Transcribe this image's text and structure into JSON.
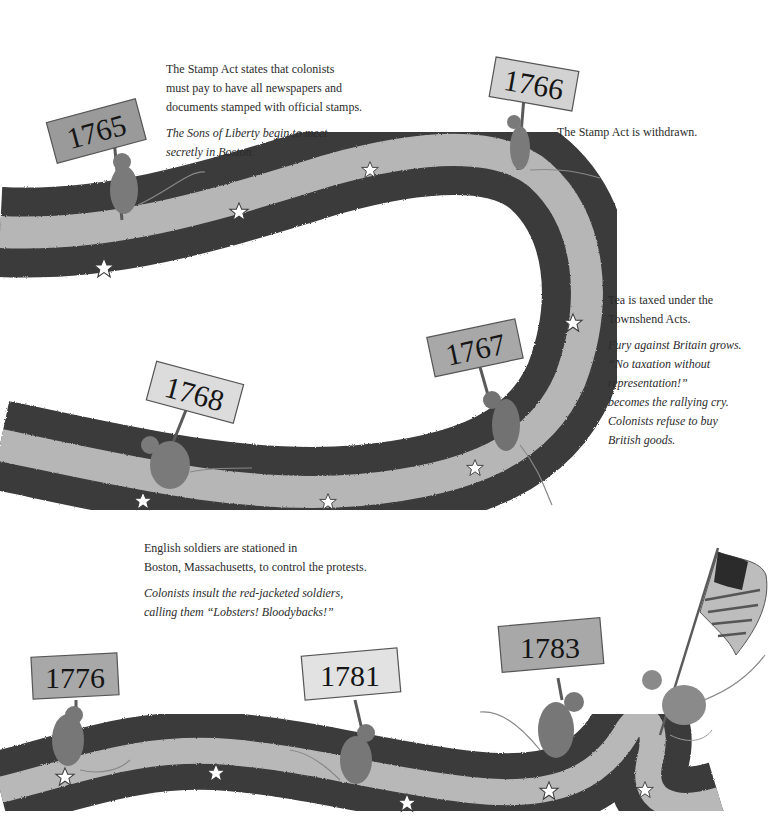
{
  "page": {
    "type": "illustrated timeline",
    "style": "grayscale watercolor illustration"
  },
  "timeline": [
    {
      "year": "1765",
      "facts": [
        "The Stamp Act states that colonists",
        "must pay to have all newspapers and",
        "documents stamped with official stamps."
      ],
      "notes": [
        "The Sons of Liberty begin to meet",
        "secretly in Boston."
      ]
    },
    {
      "year": "1766",
      "facts": [
        "The Stamp Act is withdrawn."
      ],
      "notes": []
    },
    {
      "year": "1767",
      "facts": [
        "Tea is taxed under the",
        "Townshend Acts."
      ],
      "notes": [
        "Fury against Britain grows.",
        "“No taxation without",
        "representation!”",
        "becomes the rallying cry.",
        "Colonists refuse to buy",
        "British goods."
      ]
    },
    {
      "year": "1768",
      "facts": [
        "English soldiers are stationed in",
        "Boston, Massachusetts, to control the protests."
      ],
      "notes": [
        "Colonists insult the red-jacketed soldiers,",
        "calling them “Lobsters! Bloodybacks!”"
      ]
    },
    {
      "year": "1776",
      "facts": [],
      "notes": []
    },
    {
      "year": "1781",
      "facts": [],
      "notes": []
    },
    {
      "year": "1783",
      "facts": [],
      "notes": []
    }
  ],
  "colors": {
    "ribbon_dark": "#3a3a3a",
    "ribbon_light": "#b4b4b4",
    "sign_face": "#c8c8c8",
    "sign_face_light": "#dedede",
    "mouse": "#7a7a7a",
    "text": "#2b2b2b"
  },
  "icons": {
    "star": "star-icon",
    "flag": "american-flag-icon",
    "mouse": "mouse-figure"
  }
}
